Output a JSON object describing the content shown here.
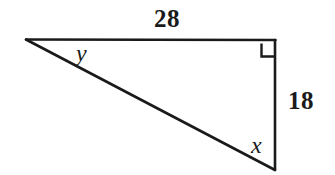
{
  "figure": {
    "shape": "right-triangle",
    "background_color": "#ffffff",
    "stroke_color": "#1a1a1a"
  },
  "geometry": {
    "vertices": {
      "left_apex": {
        "x": 26,
        "y": 39
      },
      "top_right": {
        "x": 275,
        "y": 40
      },
      "bottom_right": {
        "x": 275,
        "y": 170
      }
    },
    "right_angle_marker": {
      "at_vertex": "top_right",
      "x": 261,
      "y": 44,
      "size": 13
    }
  },
  "labels": {
    "top_side": "28",
    "right_side": "18",
    "angle_left": "y",
    "angle_bottom": "x"
  },
  "chart_data": {
    "type": "diagram",
    "sides": [
      {
        "name": "top-horizontal-leg",
        "label": "28",
        "value": 28
      },
      {
        "name": "right-vertical-leg",
        "label": "18",
        "value": 18
      },
      {
        "name": "hypotenuse",
        "label": "",
        "value": null
      }
    ],
    "angles": [
      {
        "name": "left-apex-angle",
        "label": "y",
        "value": null
      },
      {
        "name": "bottom-right-angle",
        "label": "x",
        "value": null
      },
      {
        "name": "top-right-angle",
        "label": "90",
        "value": 90,
        "marked": true
      }
    ]
  }
}
